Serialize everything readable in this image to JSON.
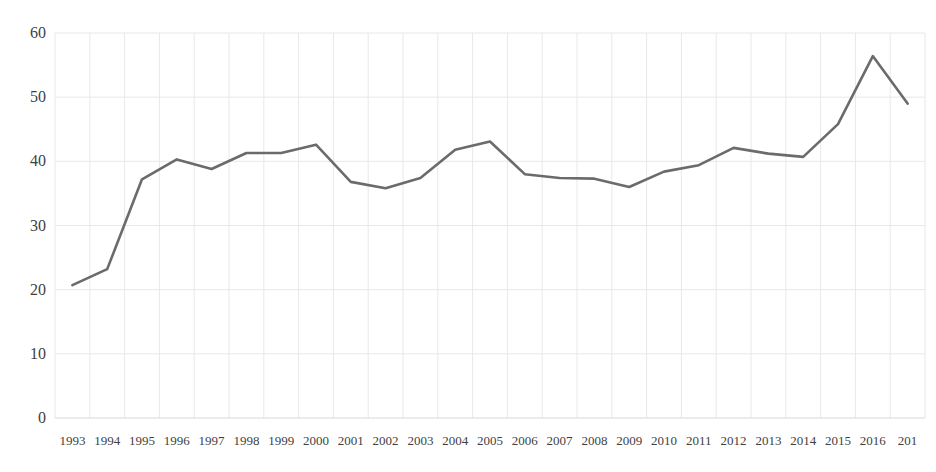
{
  "chart_data": {
    "type": "line",
    "title": "",
    "subtitle": "",
    "xlabel": "",
    "ylabel": "",
    "categories": [
      "1993",
      "1994",
      "1995",
      "1996",
      "1997",
      "1998",
      "1999",
      "2000",
      "2001",
      "2002",
      "2003",
      "2004",
      "2005",
      "2006",
      "2007",
      "2008",
      "2009",
      "2010",
      "2011",
      "2012",
      "2013",
      "2014",
      "2015",
      "2016",
      "201"
    ],
    "values": [
      20.7,
      23.2,
      37.2,
      40.3,
      38.8,
      41.3,
      41.3,
      42.6,
      36.8,
      35.8,
      37.4,
      41.8,
      43.1,
      38.0,
      37.4,
      37.3,
      36.0,
      38.4,
      39.4,
      42.1,
      41.2,
      40.7,
      45.8,
      56.4,
      49.0
    ],
    "series": [
      {
        "name": "series-1",
        "color": "#6b6b6b",
        "values": [
          20.7,
          23.2,
          37.2,
          40.3,
          38.8,
          41.3,
          41.3,
          42.6,
          36.8,
          35.8,
          37.4,
          41.8,
          43.1,
          38.0,
          37.4,
          37.3,
          36.0,
          38.4,
          39.4,
          42.1,
          41.2,
          40.7,
          45.8,
          56.4,
          49.0
        ]
      }
    ],
    "ylim": [
      0,
      60
    ],
    "yticks": [
      0,
      10,
      20,
      30,
      40,
      50,
      60
    ],
    "ytick_labels": [
      "0",
      "10",
      "20",
      "30",
      "40",
      "50",
      "60"
    ],
    "grid": {
      "horizontal": true,
      "vertical": true,
      "color": "#e8e8e8"
    },
    "legend": {
      "visible": false,
      "position": "none",
      "entries": []
    },
    "annotations": [],
    "note": "last x tick label is clipped at the right image edge"
  },
  "axis_colors": {
    "tick_text": "#3f3f3f",
    "gridline": "#e8e8e8",
    "baseline": "#d8d8d8",
    "line": "#6b6b6b",
    "background": "#ffffff"
  }
}
